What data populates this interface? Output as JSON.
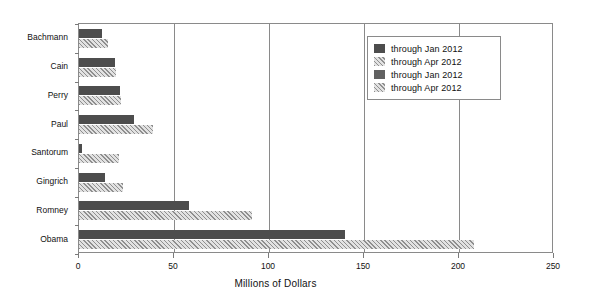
{
  "chart_data": {
    "type": "bar",
    "orientation": "horizontal",
    "title": "",
    "xlabel": "Millions of Dollars",
    "ylabel": "",
    "categories": [
      "Bachmann",
      "Cain",
      "Perry",
      "Paul",
      "Santorum",
      "Gingrich",
      "Romney",
      "Obama"
    ],
    "series": [
      {
        "name": "through Jan 2012",
        "style": "solid-dark",
        "color": "#4d4d4d",
        "values": [
          12,
          19,
          21.5,
          29,
          1.5,
          13.5,
          58,
          140
        ]
      },
      {
        "name": "through Apr 2012",
        "style": "hatched-light",
        "color": "#c6c6c6",
        "values": [
          15,
          19.5,
          22,
          39,
          21,
          23,
          91,
          208
        ]
      }
    ],
    "xlim": [
      0,
      250
    ],
    "xticks": [
      0,
      50,
      100,
      150,
      200,
      250
    ],
    "xticklabels": [
      "0",
      "50",
      "100",
      "150",
      "200",
      "250"
    ],
    "grid": "vertical",
    "legend_position": "upper-right",
    "legend_entries": [
      {
        "label": "through Jan 2012",
        "swatch": "solid-dark"
      },
      {
        "label": "through Apr 2012",
        "swatch": "hatched-light"
      },
      {
        "label": "through Jan 2012",
        "swatch": "solid-medium"
      },
      {
        "label": "through Apr 2012",
        "swatch": "hatched-light"
      }
    ]
  },
  "axis": {
    "x_title": "Millions of Dollars"
  },
  "colors": {
    "bar_dark": "#4d4d4d",
    "bar_dark_alt": "#616161",
    "bar_hatch_base": "#c6c6c6",
    "bar_hatch_line": "#8f8f8f",
    "frame": "#8a8a8a",
    "text": "#111111",
    "background": "#ffffff"
  }
}
